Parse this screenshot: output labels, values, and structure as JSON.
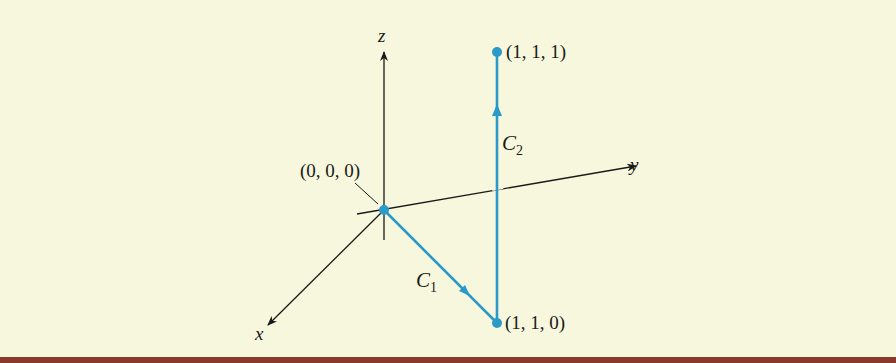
{
  "colors": {
    "background": "#f6f7dd",
    "axis": "#1a1a1a",
    "path": "#2a9ac8",
    "bottom_rule": "#8a3a2a"
  },
  "axes": {
    "x_label": "x",
    "y_label": "y",
    "z_label": "z"
  },
  "points": {
    "origin": "(0, 0, 0)",
    "p110": "(1, 1, 0)",
    "p111": "(1, 1, 1)"
  },
  "curves": {
    "c1": {
      "name": "C",
      "sub": "1"
    },
    "c2": {
      "name": "C",
      "sub": "2"
    }
  }
}
